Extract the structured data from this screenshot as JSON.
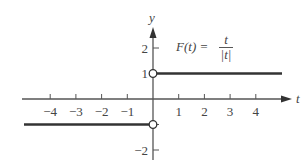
{
  "chart_data": {
    "type": "line",
    "formula": {
      "lhs": "F(t) =",
      "numerator": "t",
      "denominator": "|t|"
    },
    "xlabel": "t",
    "ylabel": "y",
    "xlim": [
      -5,
      5
    ],
    "ylim": [
      -2.5,
      2.5
    ],
    "x_ticks": [
      -4,
      -3,
      -2,
      -1,
      1,
      2,
      3,
      4
    ],
    "x_tick_labels": [
      "−4",
      "−3",
      "−2",
      "−1",
      "1",
      "2",
      "3",
      "4"
    ],
    "y_ticks": [
      2,
      1,
      -1,
      -2
    ],
    "y_tick_labels": [
      "2",
      "1",
      "",
      "−2"
    ],
    "grid": false,
    "series": [
      {
        "name": "F(t) for t<0",
        "x": [
          -5,
          0
        ],
        "y": [
          -1,
          -1
        ],
        "endpoint_open_at": [
          0,
          -1
        ]
      },
      {
        "name": "F(t) for t>0",
        "x": [
          0,
          5
        ],
        "y": [
          1,
          1
        ],
        "endpoint_open_at": [
          0,
          1
        ]
      }
    ],
    "annotations": [
      "open circle at (0, 1)",
      "open circle at (0, -1)"
    ]
  },
  "colors": {
    "line": "#333333",
    "axis": "#555555",
    "text": "#444444"
  }
}
